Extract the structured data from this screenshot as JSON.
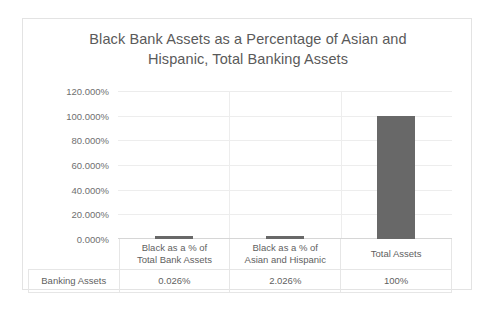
{
  "chart_data": {
    "type": "bar",
    "title": "Black Bank Assets as a Percentage of Asian and Hispanic, Total Banking Assets",
    "title_lines": [
      "Black Bank Assets as a Percentage of Asian and",
      "Hispanic, Total Banking Assets"
    ],
    "categories": [
      "Black as a % of Total Bank Assets",
      "Black as a % of Asian and Hispanic",
      "Total Assets"
    ],
    "category_lines": [
      [
        "Black as a % of",
        "Total Bank Assets"
      ],
      [
        "Black as a % of",
        "Asian and Hispanic"
      ],
      [
        "Total Assets",
        ""
      ]
    ],
    "series": [
      {
        "name": "Banking Assets",
        "values": [
          0.026,
          2.026,
          100
        ],
        "value_labels": [
          "0.026%",
          "2.026%",
          "100%"
        ]
      }
    ],
    "xlabel": "",
    "ylabel": "",
    "ylim": [
      0,
      120
    ],
    "ytick_values": [
      120,
      100,
      80,
      60,
      40,
      20,
      0
    ],
    "ytick_labels": [
      "120.000%",
      "100.000%",
      "80.000%",
      "60.000%",
      "40.000%",
      "20.000%",
      "0.000%"
    ],
    "grid": true,
    "legend": false,
    "data_table_visible": true,
    "colors": {
      "bar": "#686868",
      "title_text": "#5a5a5a",
      "axis_text": "#6f6f6f",
      "gridline": "#ededed",
      "frame_border": "#e3e3e3",
      "table_border": "#e6e6e6",
      "background": "#ffffff"
    }
  }
}
